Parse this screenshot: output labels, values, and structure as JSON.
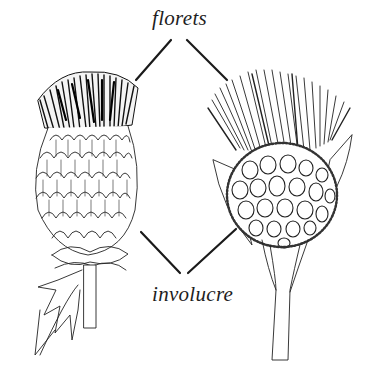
{
  "diagram": {
    "labels": {
      "florets": "florets",
      "involucre": "involucre"
    },
    "figures": [
      {
        "name": "left-thistle-head",
        "description": "Spear-thistle type head: dense dark floret tuft above ovoid involucre of spiny imbricate bracts, spiny lobed leaf at base"
      },
      {
        "name": "right-thistle-head",
        "description": "Knapweed type head: spreading pale floret fringe above globular involucre of rounded fringed bracts, flanked by lanceolate leaves, long stem"
      }
    ],
    "colors": {
      "ink": "#1e1e1e",
      "background": "#ffffff"
    }
  }
}
